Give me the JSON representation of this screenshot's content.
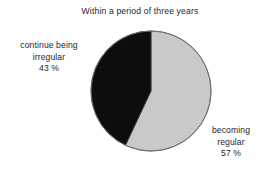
{
  "chart_data": {
    "type": "pie",
    "title": "Within a period of three years",
    "categories": [
      "becoming regular",
      "continue being irregular"
    ],
    "values": [
      57,
      43
    ],
    "value_unit": "%",
    "start_angle_deg": 0,
    "direction": "clockwise",
    "legend_position": "outside-labels",
    "grid": false,
    "slices": [
      {
        "name": "becoming regular",
        "value": 57,
        "value_text": "57 %",
        "color": "#c9c9c9",
        "label_lines": [
          "becoming",
          "regular",
          "57 %"
        ]
      },
      {
        "name": "continue being irregular",
        "value": 43,
        "value_text": "43 %",
        "color": "#0d0d0d",
        "label_lines": [
          "continue being",
          "irregular",
          "43 %"
        ]
      }
    ]
  },
  "figure": {
    "title": "Within a period of three years",
    "background_color": "#ffffff",
    "outline_color": "#6b6b6b"
  },
  "labels": {
    "irregular": {
      "line1": "continue being",
      "line2": "irregular",
      "line3": "43 %"
    },
    "regular": {
      "line1": "becoming",
      "line2": "regular",
      "line3": "57 %"
    }
  }
}
